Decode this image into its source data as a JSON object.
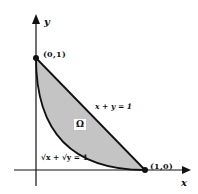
{
  "figure": {
    "axes": {
      "x_label": "x",
      "y_label": "y"
    },
    "points": [
      {
        "label": "(0,1)",
        "coords": [
          0,
          1
        ]
      },
      {
        "label": "(1,0)",
        "coords": [
          1,
          0
        ]
      }
    ],
    "curves": [
      {
        "equation_label": "x + y = 1",
        "type": "line"
      },
      {
        "equation_label": "√x + √y = 1",
        "type": "curve"
      }
    ],
    "region": {
      "label": "Ω",
      "fill_color": "#c4c4c4"
    },
    "colors": {
      "stroke": "#111111",
      "background": "#ffffff"
    }
  }
}
